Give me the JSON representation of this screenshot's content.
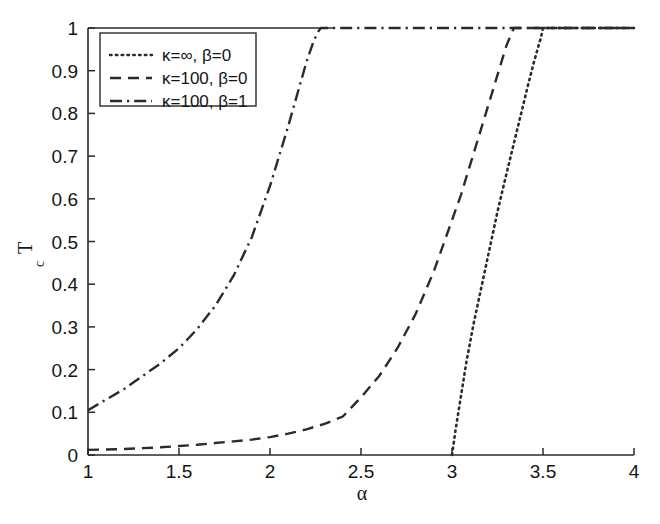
{
  "chart_data": {
    "type": "line",
    "title": "",
    "xlabel": "α",
    "ylabel": "T_c",
    "ylabel_base": "T",
    "ylabel_sub": "c",
    "xlim": [
      1,
      4
    ],
    "ylim": [
      0,
      1
    ],
    "grid": false,
    "legend_position": "top-left",
    "xticks": [
      1,
      1.5,
      2,
      2.5,
      3,
      3.5,
      4
    ],
    "xtick_labels": [
      "1",
      "1.5",
      "2",
      "2.5",
      "3",
      "3.5",
      "4"
    ],
    "yticks": [
      0,
      0.1,
      0.2,
      0.3,
      0.4,
      0.5,
      0.6,
      0.7,
      0.8,
      0.9,
      1
    ],
    "ytick_labels": [
      "0",
      "0.1",
      "0.2",
      "0.3",
      "0.4",
      "0.5",
      "0.6",
      "0.7",
      "0.8",
      "0.9",
      "1"
    ],
    "line_color": "#2b2b2b",
    "axis_color": "#2a2a2a",
    "series": [
      {
        "name": "κ=∞, β=0",
        "style": "dotted",
        "x": [
          3.0,
          3.02,
          3.05,
          3.08,
          3.12,
          3.16,
          3.2,
          3.25,
          3.3,
          3.34,
          3.38,
          3.42,
          3.45,
          3.47,
          3.49,
          3.5,
          3.6,
          3.75,
          4.0
        ],
        "values": [
          0.0,
          0.06,
          0.14,
          0.22,
          0.31,
          0.39,
          0.47,
          0.57,
          0.66,
          0.73,
          0.8,
          0.87,
          0.92,
          0.95,
          0.98,
          1.0,
          1.0,
          1.0,
          1.0
        ]
      },
      {
        "name": "κ=100, β=0",
        "style": "dashed",
        "x": [
          1.0,
          1.1,
          1.2,
          1.3,
          1.4,
          1.5,
          1.6,
          1.7,
          1.8,
          1.9,
          2.0,
          2.1,
          2.2,
          2.3,
          2.4,
          2.5,
          2.6,
          2.7,
          2.8,
          2.9,
          3.0,
          3.05,
          3.1,
          3.15,
          3.2,
          3.25,
          3.3,
          3.34,
          3.36,
          3.5,
          3.75,
          4.0
        ],
        "values": [
          0.012,
          0.013,
          0.014,
          0.016,
          0.018,
          0.021,
          0.024,
          0.028,
          0.032,
          0.036,
          0.042,
          0.05,
          0.06,
          0.073,
          0.09,
          0.135,
          0.185,
          0.25,
          0.33,
          0.43,
          0.55,
          0.61,
          0.68,
          0.75,
          0.82,
          0.89,
          0.96,
          1.0,
          1.0,
          1.0,
          1.0,
          1.0
        ]
      },
      {
        "name": "κ=100, β=1",
        "style": "dashdot",
        "x": [
          1.0,
          1.1,
          1.2,
          1.3,
          1.4,
          1.5,
          1.6,
          1.7,
          1.8,
          1.9,
          2.0,
          2.05,
          2.1,
          2.15,
          2.2,
          2.24,
          2.27,
          2.28,
          2.4,
          2.6,
          3.0,
          3.5,
          4.0
        ],
        "values": [
          0.105,
          0.13,
          0.155,
          0.185,
          0.215,
          0.25,
          0.295,
          0.35,
          0.42,
          0.51,
          0.63,
          0.7,
          0.77,
          0.845,
          0.92,
          0.97,
          0.995,
          1.0,
          1.0,
          1.0,
          1.0,
          1.0,
          1.0
        ]
      }
    ],
    "legend_entries": [
      {
        "label": "κ=∞, β=0",
        "style": "dotted"
      },
      {
        "label": "κ=100, β=0",
        "style": "dashed"
      },
      {
        "label": "κ=100, β=1",
        "style": "dashdot"
      }
    ]
  }
}
